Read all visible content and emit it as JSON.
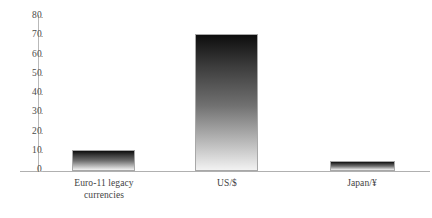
{
  "chart_data": {
    "type": "bar",
    "title": "",
    "subtitle": "",
    "xlabel": "",
    "ylabel": "",
    "ylim": [
      0,
      80
    ],
    "ytick_step": 10,
    "yticks": [
      80,
      70,
      60,
      50,
      40,
      30,
      20,
      10,
      0
    ],
    "grid": false,
    "legend": null,
    "categories": [
      "Euro-11 legacy\ncurrencies",
      "US/$",
      "Japan/¥"
    ],
    "values": [
      11,
      71,
      5
    ],
    "bar_style": {
      "gradient_top": "#0d0d0d",
      "gradient_bottom": "#f2f2f2",
      "outline": "#a8a8a8"
    },
    "axis_color": "#b9b9b9",
    "text_color": "#3f3f3f"
  },
  "bars": [
    {
      "label": "Euro-11 legacy\ncurrencies",
      "value": 11,
      "left": 72,
      "width": 63,
      "label_left": 56,
      "label_width": 96
    },
    {
      "label": "US/$",
      "value": 71,
      "left": 195,
      "width": 63,
      "label_left": 180,
      "label_width": 94
    },
    {
      "label": "Japan/¥",
      "value": 5,
      "left": 330,
      "width": 65,
      "label_left": 312,
      "label_width": 100
    }
  ]
}
